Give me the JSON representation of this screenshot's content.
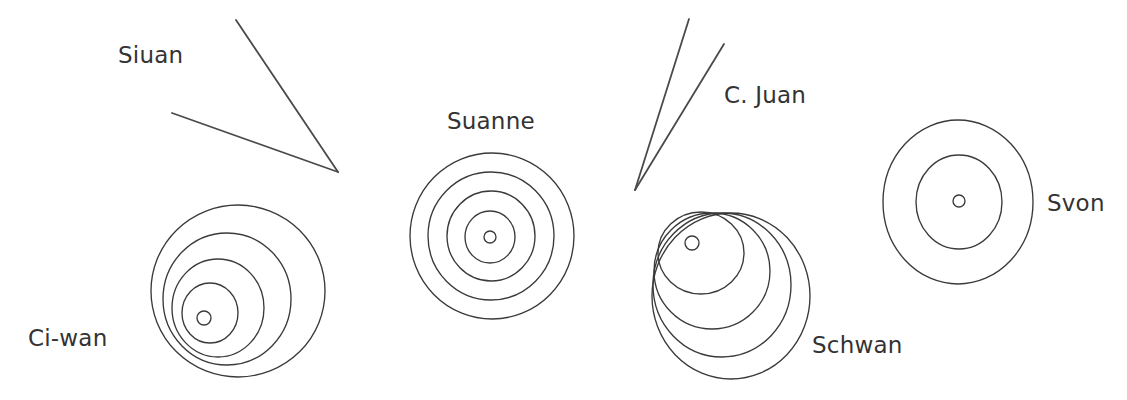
{
  "figure": {
    "background_color": "#ffffff",
    "stroke_color": "#3a3a3a",
    "text_color": "#333333",
    "width": 1127,
    "height": 400
  },
  "labels": {
    "siuan": "Siuan",
    "ci_wan": "Ci-wan",
    "suanne": "Suanne",
    "c_juan": "C. Juan",
    "schwan": "Schwan",
    "svon": "Svon"
  },
  "chart_data": {
    "type": "diagram",
    "xlabel": "",
    "ylabel": "",
    "grid": false,
    "legend": "none",
    "xlim": [
      0,
      1127
    ],
    "ylim": [
      0,
      400
    ],
    "annotations": [
      {
        "text": "Siuan",
        "x": 118,
        "y": 44
      },
      {
        "text": "Suanne",
        "x": 447,
        "y": 110
      },
      {
        "text": "C. Juan",
        "x": 724,
        "y": 84
      },
      {
        "text": "Svon",
        "x": 1047,
        "y": 192
      },
      {
        "text": "Ci-wan",
        "x": 28,
        "y": 327
      },
      {
        "text": "Schwan",
        "x": 812,
        "y": 334
      }
    ],
    "groups": [
      {
        "name": "Siuan",
        "kind": "angle",
        "label": "Siuan",
        "vertex": [
          338,
          172
        ],
        "rays": [
          {
            "from": [
              338,
              172
            ],
            "to": [
              236,
              20
            ]
          },
          {
            "from": [
              338,
              172
            ],
            "to": [
              172,
              113
            ]
          }
        ],
        "ring_count": 0
      },
      {
        "name": "Ci-wan",
        "kind": "concentric-circles",
        "label": "Ci-wan",
        "ring_count": 4,
        "center_dot": {
          "cx": 204,
          "cy": 318,
          "r": 7
        },
        "circles": [
          {
            "cx": 238,
            "cy": 291,
            "rx": 87,
            "ry": 86
          },
          {
            "cx": 227,
            "cy": 299,
            "rx": 64,
            "ry": 66
          },
          {
            "cx": 218,
            "cy": 308,
            "rx": 46,
            "ry": 49
          },
          {
            "cx": 210,
            "cy": 313,
            "rx": 28,
            "ry": 30
          }
        ]
      },
      {
        "name": "Suanne",
        "kind": "concentric-circles",
        "label": "Suanne",
        "ring_count": 4,
        "center_dot": {
          "cx": 490,
          "cy": 237,
          "r": 6
        },
        "circles": [
          {
            "cx": 492,
            "cy": 236,
            "rx": 82,
            "ry": 83
          },
          {
            "cx": 491,
            "cy": 236,
            "rx": 63,
            "ry": 64
          },
          {
            "cx": 491,
            "cy": 236,
            "rx": 44,
            "ry": 45
          },
          {
            "cx": 490,
            "cy": 237,
            "rx": 25,
            "ry": 26
          }
        ]
      },
      {
        "name": "C. Juan",
        "kind": "angle",
        "label": "C. Juan",
        "vertex": [
          635,
          190
        ],
        "rays": [
          {
            "from": [
              635,
              190
            ],
            "to": [
              689,
              19
            ]
          },
          {
            "from": [
              635,
              190
            ],
            "to": [
              724,
              44
            ]
          }
        ],
        "ring_count": 0
      },
      {
        "name": "Schwan",
        "kind": "concentric-circles",
        "label": "Schwan",
        "ring_count": 4,
        "center_dot": {
          "cx": 692,
          "cy": 243,
          "r": 7
        },
        "circles": [
          {
            "cx": 731,
            "cy": 296,
            "rx": 79,
            "ry": 83
          },
          {
            "cx": 722,
            "cy": 285,
            "rx": 69,
            "ry": 72
          },
          {
            "cx": 712,
            "cy": 271,
            "rx": 58,
            "ry": 58
          },
          {
            "cx": 701,
            "cy": 253,
            "rx": 43,
            "ry": 41
          }
        ]
      },
      {
        "name": "Svon",
        "kind": "concentric-circles",
        "label": "Svon",
        "ring_count": 2,
        "center_dot": {
          "cx": 959,
          "cy": 201,
          "r": 6
        },
        "circles": [
          {
            "cx": 958,
            "cy": 202,
            "rx": 75,
            "ry": 82
          },
          {
            "cx": 959,
            "cy": 202,
            "rx": 43,
            "ry": 47
          }
        ]
      }
    ]
  }
}
